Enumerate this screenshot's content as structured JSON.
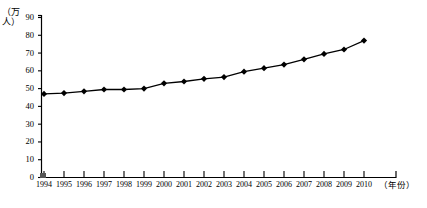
{
  "chart_data": {
    "type": "line",
    "title": "",
    "xlabel": "（年份）",
    "ylabel": "（万人）",
    "ylim": [
      0,
      90
    ],
    "yticks": [
      0,
      10,
      20,
      30,
      40,
      50,
      60,
      70,
      80,
      90
    ],
    "grid": false,
    "legend": "none",
    "marker": "diamond",
    "line_color": "#000000",
    "marker_color": "#000000",
    "categories": [
      "1994",
      "1995",
      "1996",
      "1997",
      "1998",
      "1999",
      "2000",
      "2001",
      "2002",
      "2003",
      "2004",
      "2005",
      "2006",
      "2007",
      "2008",
      "2009",
      "2010"
    ],
    "values": [
      47,
      47.5,
      48.5,
      49.5,
      49.5,
      50,
      53,
      54,
      55.5,
      56.5,
      59.5,
      61.5,
      63.5,
      66.5,
      69.5,
      72,
      77
    ],
    "series": [
      {
        "name": "人口",
        "values": [
          47,
          47.5,
          48.5,
          49.5,
          49.5,
          50,
          53,
          54,
          55.5,
          56.5,
          59.5,
          61.5,
          63.5,
          66.5,
          69.5,
          72,
          77
        ]
      }
    ]
  }
}
